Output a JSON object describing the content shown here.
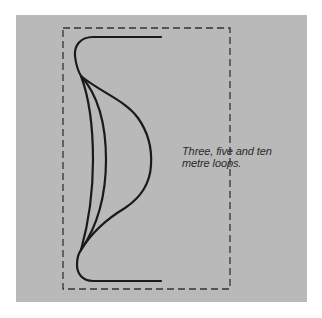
{
  "figure": {
    "background_color": "#b9b9b9",
    "stroke_color": "#1a1a1a",
    "boundary_color": "#333333",
    "caption": {
      "line1": "Three, five and ten",
      "line2": "metre loops."
    },
    "loops": [
      {
        "name": "three-metre-loop",
        "label": "Three metre loop"
      },
      {
        "name": "five-metre-loop",
        "label": "Five metre loop"
      },
      {
        "name": "ten-metre-loop",
        "label": "Ten metre loop"
      }
    ],
    "boundary": {
      "style": "dashed",
      "shape": "rectangle"
    }
  }
}
